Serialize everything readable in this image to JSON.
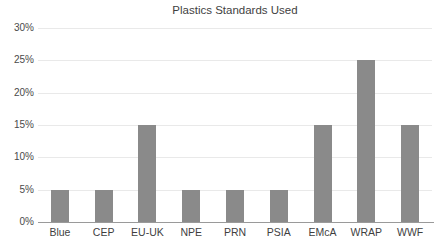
{
  "chart_data": {
    "type": "bar",
    "title": "Plastics Standards Used",
    "xlabel": "",
    "ylabel": "",
    "categories": [
      "Blue",
      "CEP",
      "EU-UK",
      "NPE",
      "PRN",
      "PSIA",
      "EMcA",
      "WRAP",
      "WWF"
    ],
    "values": [
      5,
      5,
      15,
      5,
      5,
      5,
      15,
      25,
      15
    ],
    "value_unit": "%",
    "ylim": [
      0,
      30
    ],
    "ytick_values": [
      30,
      25,
      20,
      15,
      10,
      5,
      0
    ],
    "ytick_labels": [
      "30%",
      "25%",
      "20%",
      "15%",
      "10%",
      "5%",
      "0%"
    ],
    "grid": true,
    "grid_axis": "y",
    "legend": false,
    "legend_position": "none",
    "bar_color": "#8a8a8a",
    "gridline_color": "#e9e9e9",
    "axis_color": "#9a9a9a",
    "text_color": "#3f3f3f",
    "background_color": "#ffffff"
  }
}
